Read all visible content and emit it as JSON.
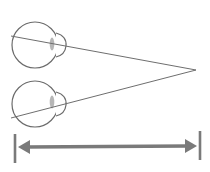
{
  "diagram": {
    "colors": {
      "background": "#ffffff",
      "eye_outline": "#6b6b6b",
      "sight_line": "#6e6e6e",
      "lens": "#a9a9a9",
      "arrow": "#7a7a7a"
    },
    "eyes": [
      {
        "name": "top-eye",
        "cx": 35,
        "cy": 45,
        "r": 24
      },
      {
        "name": "bottom-eye",
        "cx": 35,
        "cy": 104,
        "r": 24
      }
    ],
    "convergence_point": {
      "x": 196,
      "y": 70
    },
    "distance_arrow": {
      "y": 147,
      "x_start": 15,
      "x_end": 200,
      "label": ""
    }
  }
}
